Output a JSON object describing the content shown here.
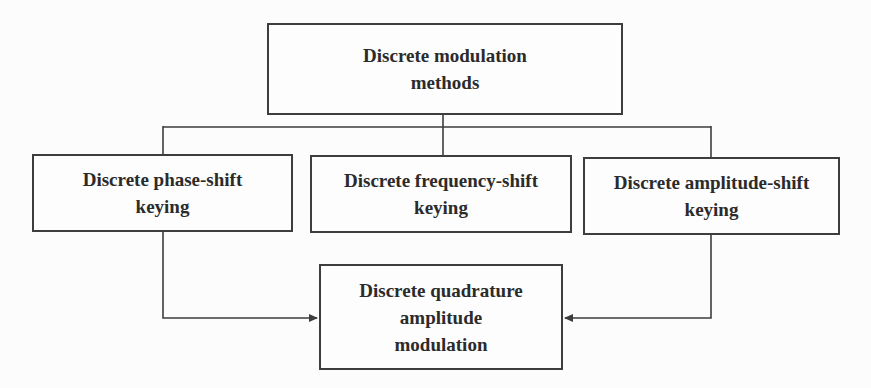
{
  "diagram": {
    "type": "flowchart"
  },
  "nodes": {
    "root": {
      "label": "Discrete modulation methods",
      "lines": [
        "Discrete modulation",
        "methods"
      ]
    },
    "psk": {
      "label": "Discrete phase-shift keying",
      "lines": [
        "Discrete phase-shift",
        "keying"
      ]
    },
    "fsk": {
      "label": "Discrete frequency-shift keying",
      "lines": [
        "Discrete frequency-shift",
        "keying"
      ]
    },
    "ask": {
      "label": "Discrete amplitude-shift keying",
      "lines": [
        "Discrete amplitude-shift",
        "keying"
      ]
    },
    "qam": {
      "label": "Discrete quadrature amplitude modulation",
      "lines": [
        "Discrete quadrature",
        "amplitude",
        "modulation"
      ]
    }
  },
  "edges": [
    {
      "from": "root",
      "to": "psk",
      "arrow": false
    },
    {
      "from": "root",
      "to": "fsk",
      "arrow": false
    },
    {
      "from": "root",
      "to": "ask",
      "arrow": false
    },
    {
      "from": "psk",
      "to": "qam",
      "arrow": true
    },
    {
      "from": "ask",
      "to": "qam",
      "arrow": true
    }
  ],
  "colors": {
    "background": "#fcfcfc",
    "box_background": "#fdfdfd",
    "line": "#3d3d3d",
    "text": "#2b2b2b"
  }
}
